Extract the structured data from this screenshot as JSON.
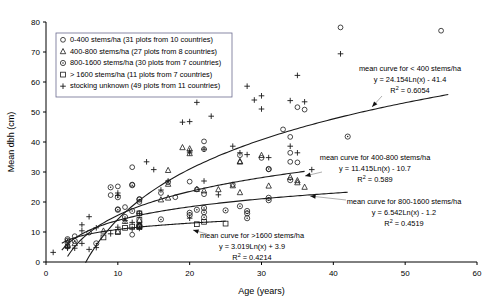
{
  "chart_data": {
    "type": "scatter",
    "title": "",
    "xlabel": "Age (years)",
    "ylabel": "Mean dbh (cm)",
    "xlim": [
      0,
      60
    ],
    "ylim": [
      0,
      80
    ],
    "xticks": [
      0,
      10,
      20,
      30,
      40,
      50,
      60
    ],
    "yticks": [
      0,
      10,
      20,
      30,
      40,
      50,
      60,
      70,
      80
    ],
    "grid": false,
    "legend_position": "top-left",
    "series": [
      {
        "name": "0-400 stems/ha",
        "legend_label": "0-400 stems/ha (31 plots from 10 countries)",
        "marker": "open-circle",
        "plots": 31,
        "countries": 10,
        "points": [
          [
            3,
            7.2
          ],
          [
            3,
            6.3
          ],
          [
            4,
            8.6
          ],
          [
            6,
            9.8
          ],
          [
            9,
            22.3
          ],
          [
            10,
            17.6
          ],
          [
            10,
            25.2
          ],
          [
            11,
            18.3
          ],
          [
            12,
            31.6
          ],
          [
            12,
            25.8
          ],
          [
            12,
            9.1
          ],
          [
            13,
            21.0
          ],
          [
            13,
            20.0
          ],
          [
            13,
            12.2
          ],
          [
            16,
            23.0
          ],
          [
            17,
            26.6
          ],
          [
            18,
            21.6
          ],
          [
            20,
            26.8
          ],
          [
            21,
            24.2
          ],
          [
            22,
            40.2
          ],
          [
            22,
            37.6
          ],
          [
            22,
            22.6
          ],
          [
            26,
            25.8
          ],
          [
            27,
            35.6
          ],
          [
            30,
            34.7
          ],
          [
            31,
            30.9
          ],
          [
            33,
            44.2
          ],
          [
            34,
            41.7
          ],
          [
            34,
            36.4
          ],
          [
            34,
            33.4
          ],
          [
            35,
            33.2
          ],
          [
            35,
            51.6
          ],
          [
            36,
            50.8
          ],
          [
            41,
            78.2
          ],
          [
            55,
            77.1
          ]
        ]
      },
      {
        "name": "400-800 stems/ha",
        "legend_label": "400-800 stems/ha (27 plots from 8 countries)",
        "marker": "open-triangle",
        "plots": 27,
        "countries": 8,
        "points": [
          [
            3,
            5.6
          ],
          [
            4,
            6.2
          ],
          [
            8,
            10.4
          ],
          [
            10,
            10.2
          ],
          [
            11,
            13.6
          ],
          [
            13,
            14.0
          ],
          [
            13,
            12.1
          ],
          [
            16,
            20.8
          ],
          [
            17,
            26.0
          ],
          [
            17,
            21.4
          ],
          [
            17,
            30.6
          ],
          [
            19,
            38.2
          ],
          [
            20,
            36.2
          ],
          [
            20,
            37.8
          ],
          [
            21,
            24.3
          ],
          [
            22,
            23.8
          ],
          [
            24,
            24.2
          ],
          [
            26,
            25.5
          ],
          [
            27,
            33.6
          ],
          [
            27,
            33.4
          ],
          [
            27,
            23.2
          ],
          [
            30,
            35.6
          ],
          [
            31,
            25.4
          ],
          [
            34,
            28.3
          ],
          [
            35,
            27.2
          ],
          [
            35,
            26.5
          ],
          [
            36,
            25.0
          ]
        ]
      },
      {
        "name": "800-1600 stems/ha",
        "legend_label": "800-1600 stems/ha (30 plots from 7 countries)",
        "marker": "dotted-circle",
        "plots": 30,
        "countries": 7,
        "points": [
          [
            3,
            7.6
          ],
          [
            3,
            5.2
          ],
          [
            4,
            7.0
          ],
          [
            7,
            6.2
          ],
          [
            9,
            24.9
          ],
          [
            10,
            21.6
          ],
          [
            10,
            17.4
          ],
          [
            11,
            15.0
          ],
          [
            12,
            25.6
          ],
          [
            12,
            17.0
          ],
          [
            13,
            20.8
          ],
          [
            13,
            16.2
          ],
          [
            13,
            11.9
          ],
          [
            16,
            14.2
          ],
          [
            20,
            16.4
          ],
          [
            20,
            15.6
          ],
          [
            21,
            17.4
          ],
          [
            22,
            18.0
          ],
          [
            22,
            16.6
          ],
          [
            22,
            14.9
          ],
          [
            25,
            17.2
          ],
          [
            27,
            18.6
          ],
          [
            28,
            17.0
          ],
          [
            28,
            16.2
          ],
          [
            28,
            14.6
          ],
          [
            31,
            21.4
          ],
          [
            31,
            20.6
          ],
          [
            31,
            31.0
          ],
          [
            34,
            27.3
          ],
          [
            42,
            41.8
          ]
        ]
      },
      {
        "name": "> 1600 stems/ha",
        "legend_label": "> 1600 stems/ha (11 plots from 7 countries)",
        "marker": "open-square",
        "plots": 11,
        "countries": 7,
        "points": [
          [
            8,
            8.2
          ],
          [
            10,
            10.0
          ],
          [
            11,
            11.4
          ],
          [
            12,
            11.8
          ],
          [
            13,
            16.2
          ],
          [
            13,
            14.0
          ],
          [
            13,
            12.0
          ],
          [
            13,
            11.6
          ],
          [
            21,
            12.6
          ],
          [
            22,
            13.4
          ],
          [
            25,
            12.8
          ]
        ]
      },
      {
        "name": "stocking unknown",
        "legend_label": "stocking unknown (49 plots from 11 countries)",
        "marker": "plus",
        "plots": 49,
        "countries": 11,
        "points": [
          [
            1,
            3.2
          ],
          [
            3,
            4.6
          ],
          [
            3,
            5.0
          ],
          [
            4,
            4.6
          ],
          [
            5,
            12.4
          ],
          [
            5,
            6.2
          ],
          [
            6,
            15.1
          ],
          [
            6,
            4.2
          ],
          [
            7,
            11.4
          ],
          [
            7,
            4.8
          ],
          [
            9,
            9.4
          ],
          [
            10,
            23.0
          ],
          [
            10,
            22.2
          ],
          [
            10,
            11.6
          ],
          [
            11,
            13.8
          ],
          [
            12,
            13.2
          ],
          [
            13,
            16.2
          ],
          [
            13,
            11.2
          ],
          [
            14,
            33.4
          ],
          [
            15,
            30.8
          ],
          [
            16,
            24.0
          ],
          [
            17,
            27.0
          ],
          [
            19,
            46.6
          ],
          [
            20,
            46.8
          ],
          [
            20,
            36.4
          ],
          [
            20,
            37.0
          ],
          [
            21,
            53.2
          ],
          [
            22,
            37.6
          ],
          [
            22,
            27.0
          ],
          [
            23,
            48.6
          ],
          [
            24,
            22.4
          ],
          [
            26,
            38.6
          ],
          [
            27,
            36.4
          ],
          [
            28,
            58.6
          ],
          [
            28,
            35.8
          ],
          [
            29,
            54.0
          ],
          [
            30,
            55.4
          ],
          [
            30,
            51.0
          ],
          [
            31,
            34.8
          ],
          [
            34,
            38.6
          ],
          [
            34,
            53.8
          ],
          [
            35,
            36.4
          ],
          [
            35,
            62.2
          ],
          [
            36,
            53.4
          ],
          [
            41,
            69.4
          ],
          [
            37,
            30.8
          ],
          [
            20,
            14.6
          ],
          [
            5,
            10.4
          ],
          [
            12,
            11.0
          ]
        ]
      }
    ],
    "trend_curves": [
      {
        "id": "lt400",
        "label": "mean curve for < 400 stems/ha",
        "equation": "y = 24.154Ln(x) - 41.4",
        "r_squared_label": "R",
        "r_squared_value": "= 0.6054",
        "coef": 24.154,
        "intercept": -41.4,
        "r2": 0.6054,
        "x_start": 5.5,
        "x_end": 56
      },
      {
        "id": "400to800",
        "label": "mean curve for 400-800 stems/ha",
        "equation": "y = 11.415Ln(x) - 10.7",
        "r_squared_label": "R",
        "r_squared_value": "= 0.589",
        "coef": 11.415,
        "intercept": -10.7,
        "r2": 0.589,
        "x_start": 3.0,
        "x_end": 36
      },
      {
        "id": "800to1600",
        "label": "mean curve for 800-1600 stems/ha",
        "equation": "y = 6.542Ln(x) - 1.2",
        "r_squared_label": "R",
        "r_squared_value": "= 0.4519",
        "coef": 6.542,
        "intercept": -1.2,
        "r2": 0.4519,
        "x_start": 2.2,
        "x_end": 42
      },
      {
        "id": "gt1600",
        "label": "mean curve for >1600 stems/ha",
        "equation": "y = 3.019Ln(x) + 3.9",
        "r_squared_label": "R",
        "r_squared_value": "= 0.4214",
        "coef": 3.019,
        "intercept": 3.9,
        "r2": 0.4214,
        "x_start": 2.2,
        "x_end": 25
      }
    ]
  }
}
